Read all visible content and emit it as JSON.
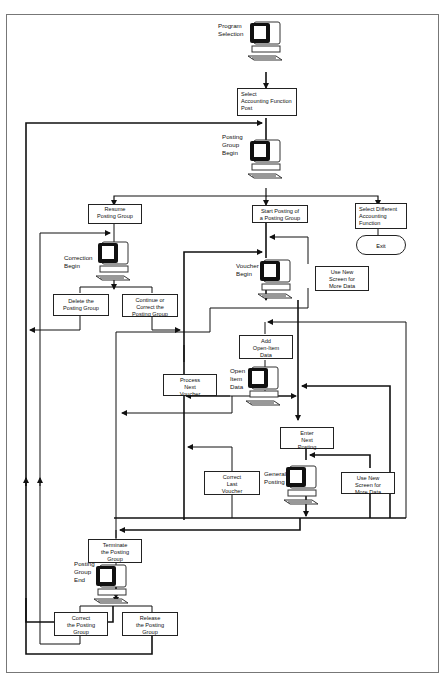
{
  "diagram": {
    "screens": [
      {
        "id": "program-selection",
        "label": [
          "Program",
          "Selection"
        ]
      },
      {
        "id": "posting-group-begin",
        "label": [
          "Posting",
          "Group",
          "Begin"
        ]
      },
      {
        "id": "correction-begin",
        "label": [
          "Correction",
          "Begin"
        ]
      },
      {
        "id": "voucher-begin",
        "label": [
          "Voucher",
          "Begin"
        ]
      },
      {
        "id": "open-item-data",
        "label": [
          "Open",
          "Item",
          "Data"
        ]
      },
      {
        "id": "general-posting",
        "label": [
          "General",
          "Posting"
        ]
      },
      {
        "id": "posting-group-end",
        "label": [
          "Posting",
          "Group",
          "End"
        ]
      }
    ],
    "actions": {
      "select_accounting_function_post": [
        "Select",
        "Accounting Function",
        "Post"
      ],
      "resume_posting_group": [
        "Resume",
        "a",
        "Posting Group"
      ],
      "start_posting_group": [
        "Start Posting of",
        "a Posting Group"
      ],
      "select_different_function": [
        "Select Different",
        "Accounting",
        "Function"
      ],
      "delete_posting_group": [
        "Delete the",
        "Posting Group"
      ],
      "continue_correct_posting_group": [
        "Continue or",
        "Correct the",
        "Posting Group"
      ],
      "use_new_screen_1": [
        "Use New",
        "Screen for",
        "More Data"
      ],
      "add_open_item_data": [
        "Add",
        "Open-Item",
        "Data"
      ],
      "process_next_voucher": [
        "Process",
        "Next",
        "Voucher"
      ],
      "enter_next_posting": [
        "Enter",
        "Next",
        "Posting"
      ],
      "correct_last_voucher": [
        "Correct",
        "Last",
        "Voucher"
      ],
      "use_new_screen_2": [
        "Use New",
        "Screen for",
        "More Data"
      ],
      "terminate_posting_group": [
        "Terminate",
        "the Posting",
        "Group"
      ],
      "correct_posting_group": [
        "Correct",
        "the Posting",
        "Group"
      ],
      "release_posting_group": [
        "Release",
        "the Posting",
        "Group"
      ]
    },
    "terminal": {
      "exit": "Exit"
    }
  }
}
